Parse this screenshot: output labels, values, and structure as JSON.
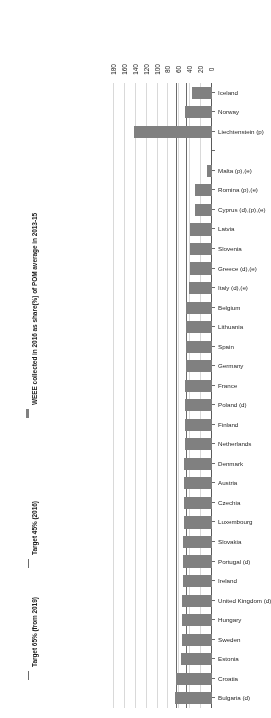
{
  "chart_data": {
    "type": "bar",
    "orientation": "horizontal",
    "title": "",
    "xlabel": "",
    "ylabel": "",
    "xlim": [
      0,
      180
    ],
    "xticks": [
      "0",
      "20",
      "40",
      "60",
      "80",
      "100",
      "120",
      "140",
      "160",
      "180"
    ],
    "grid": true,
    "bar_color": "#808080",
    "reference_lines": [
      {
        "label": "Target 45% (2016)",
        "value": 45,
        "color": "#6b6b6b"
      },
      {
        "label": "Target 65% (from 2019)",
        "value": 65,
        "color": "#6b6b6b"
      }
    ],
    "legend_position": "right",
    "legend": [
      {
        "label": "WEEE collected in 2016 as share(%) of POM average in 2013-15",
        "type": "bar",
        "color": "#808080"
      },
      {
        "label": "Target 45% (2016)",
        "type": "line",
        "color": "#6b6b6b"
      },
      {
        "label": "Target 65% (from 2019)",
        "type": "line",
        "color": "#6b6b6b"
      }
    ],
    "categories": [
      "Bulgaria (d)",
      "Croatia",
      "Estonia",
      "Sweden",
      "Hungary",
      "United Kingdom (d)",
      "Ireland",
      "Portugal (d)",
      "Slovakia",
      "Luxembourg",
      "Czechia",
      "Austria",
      "Denmark",
      "Netherlands",
      "Finland",
      "Poland (d)",
      "France",
      "Germany",
      "Spain",
      "Lithuania",
      "Belgium",
      "Italy (d),(e)",
      "Greece (d),(e)",
      "Slovenia",
      "Latvia",
      "Cyprus (d),(p),(e)",
      "Romina (p),(e)",
      "Malta (p),(e)",
      "",
      "Liechtenstein (p)",
      "Norway",
      "Iceland"
    ],
    "values": [
      68,
      66,
      57,
      56,
      55,
      55,
      54,
      54,
      53,
      52,
      52,
      51,
      51,
      50,
      50,
      49,
      49,
      48,
      48,
      47,
      47,
      42,
      41,
      41,
      40,
      32,
      31,
      10,
      null,
      143,
      50,
      37
    ]
  }
}
